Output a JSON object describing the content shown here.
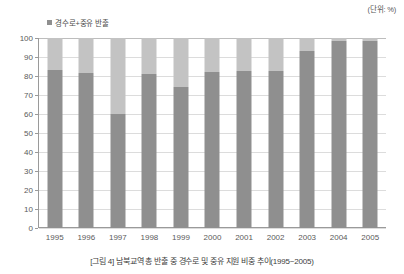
{
  "unit_label": "(단위: %)",
  "legend": {
    "swatch_color": "#8f8f8f",
    "label": "경수로+중유 반출"
  },
  "caption": {
    "figure_number": "[그림 4]",
    "text": "남북교역 총 반출 중 경수로 및 중유 지원 비중 추이(1995~2005)",
    "full": "[그림 4] 남북교역 총 반출 중 경수로 및 중유 지원 비중 추이(1995~2005)"
  },
  "chart_data": {
    "type": "bar",
    "subtype": "stacked-bar",
    "title": "남북교역 총 반출 중 경수로 및 중유 지원 비중 추이(1995~2005)",
    "xlabel": "",
    "ylabel": "",
    "unit": "%",
    "ylim": [
      0,
      100
    ],
    "ytick_labels": [
      "0",
      "10",
      "20",
      "30",
      "40",
      "50",
      "60",
      "70",
      "80",
      "90",
      "100"
    ],
    "yticks": [
      0,
      10,
      20,
      30,
      40,
      50,
      60,
      70,
      80,
      90,
      100
    ],
    "grid": true,
    "legend_position": "top-left",
    "categories": [
      "1995",
      "1996",
      "1997",
      "1998",
      "1999",
      "2000",
      "2001",
      "2002",
      "2003",
      "2004",
      "2005"
    ],
    "series": [
      {
        "name": "경수로+중유 반출",
        "color": "#8f8f8f",
        "values": [
          83,
          81.5,
          60,
          81,
          74,
          82,
          82.5,
          82.5,
          93,
          98.5,
          98.5
        ]
      },
      {
        "name": "기타 반출",
        "color": "#c3c3c3",
        "values": [
          17,
          18.5,
          40,
          19,
          26,
          18,
          17.5,
          17.5,
          7,
          1.5,
          1.5
        ]
      }
    ],
    "totals": [
      100,
      100,
      100,
      100,
      100,
      100,
      100,
      100,
      100,
      100,
      100
    ]
  }
}
